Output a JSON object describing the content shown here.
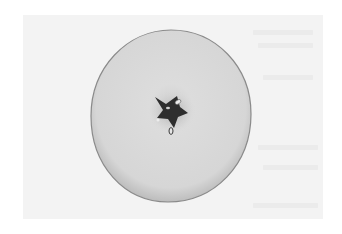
{
  "image": {
    "subject": "apple cross-section",
    "description": "Grayscale photograph of a horizontally sliced apple showing the star-shaped core with seeds, on a light page with faint bleed-through text",
    "colors": {
      "background": "#ffffff",
      "page": "#f3f3f3",
      "flesh": "#d9d9d9",
      "flesh_edge": "#8a8a8a",
      "core": "#2e2e2e",
      "seed": "#e8e8e8"
    },
    "apple": {
      "cx": 171,
      "cy": 116,
      "rx": 80,
      "ry": 86
    },
    "core": {
      "cx": 172,
      "cy": 112
    }
  }
}
